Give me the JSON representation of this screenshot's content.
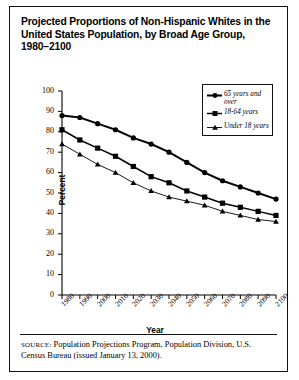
{
  "figure": {
    "title": "Projected Proportions of Non-Hispanic Whites in the United States Population, by Broad Age Group, 1980–2100",
    "source_prefix": "SOURCE:",
    "source_text": " Population Projections Program, Population Division, U.S. Census Bureau (issued January 13, 2000)."
  },
  "chart_data": {
    "type": "line",
    "title": "Projected Proportions of Non-Hispanic Whites in the United States Population, by Broad Age Group, 1980–2100",
    "xlabel": "Year",
    "ylabel": "Percent",
    "ylim": [
      0,
      100
    ],
    "ytick_labels": [
      "0",
      "10",
      "20",
      "30",
      "40",
      "50",
      "60",
      "70",
      "80",
      "90",
      "100"
    ],
    "yticks": [
      0,
      10,
      20,
      30,
      40,
      50,
      60,
      70,
      80,
      90,
      100
    ],
    "categories": [
      "1980",
      "1990",
      "2000",
      "2010",
      "2020",
      "2030",
      "2040",
      "2050",
      "2060",
      "2070",
      "2080",
      "2090",
      "2100"
    ],
    "x": [
      1980,
      1990,
      2000,
      2010,
      2020,
      2030,
      2040,
      2050,
      2060,
      2070,
      2080,
      2090,
      2100
    ],
    "grid": false,
    "legend_position": "upper right",
    "series": [
      {
        "name": "65 years and over",
        "marker": "circle",
        "values": [
          88,
          87,
          84,
          81,
          77,
          74,
          70,
          65,
          60,
          56,
          53,
          50,
          47
        ]
      },
      {
        "name": "18-64 years",
        "marker": "square",
        "values": [
          81,
          76,
          72,
          68,
          63,
          58,
          55,
          51,
          48,
          45,
          43,
          41,
          39
        ]
      },
      {
        "name": "Under 18 years",
        "marker": "triangle",
        "values": [
          74,
          69,
          64,
          60,
          55,
          51,
          48,
          46,
          44,
          41,
          39,
          37,
          36
        ]
      }
    ]
  },
  "legend": {
    "items": [
      {
        "label": "65 years and\nover",
        "marker": "circle"
      },
      {
        "label": "18-64 years",
        "marker": "square"
      },
      {
        "label": "Under 18 years",
        "marker": "triangle"
      }
    ]
  }
}
